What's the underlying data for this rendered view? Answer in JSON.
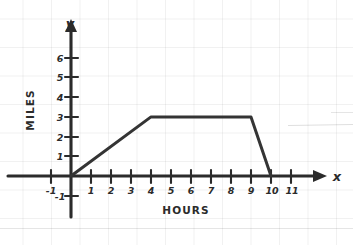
{
  "chart_data": {
    "type": "line",
    "title": "",
    "xlabel": "HOURS",
    "ylabel": "MILES",
    "x_axis_name": "x",
    "y_axis_name": "y",
    "xlim": [
      -1.6,
      12.2
    ],
    "ylim": [
      -1.9,
      7.4
    ],
    "xticks": [
      -1,
      1,
      2,
      3,
      4,
      5,
      6,
      7,
      8,
      9,
      10,
      11
    ],
    "xtick_labels": [
      "-1",
      "1",
      "2",
      "3",
      "4",
      "5",
      "6",
      "7",
      "8",
      "9",
      "10",
      "11"
    ],
    "yticks": [
      -1,
      1,
      2,
      3,
      4,
      5,
      6
    ],
    "ytick_labels": [
      "-1",
      "1",
      "2",
      "3",
      "4",
      "5",
      "6"
    ],
    "grid": true,
    "grid_style": "faint graph paper",
    "legend": "none",
    "series": [
      {
        "name": "distance",
        "x": [
          0,
          4,
          9,
          10
        ],
        "values": [
          0,
          3,
          3,
          0
        ]
      }
    ],
    "annotations": [],
    "colors": {
      "curve": "#343434",
      "axis": "#2b2b2b",
      "grid": "#f0f0f0",
      "paper": "#ffffff"
    }
  }
}
